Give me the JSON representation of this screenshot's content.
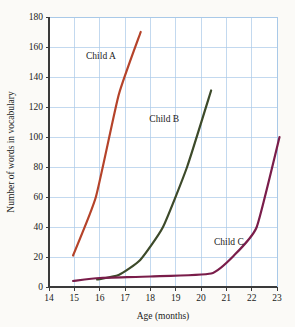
{
  "chart_data": {
    "type": "line",
    "title": "",
    "xlabel": "Age (months)",
    "ylabel": "Number of words in vocabulary",
    "xlim": [
      14,
      23
    ],
    "ylim": [
      0,
      180
    ],
    "xticks": [
      14,
      15,
      16,
      17,
      18,
      19,
      20,
      21,
      22,
      23
    ],
    "xtick_labels": [
      "14",
      "15",
      "16",
      "17",
      "18",
      "19",
      "20",
      "21",
      "22",
      "23"
    ],
    "yticks": [
      0,
      20,
      40,
      60,
      80,
      100,
      120,
      140,
      160,
      180
    ],
    "ytick_labels": [
      "0",
      "20",
      "40",
      "60",
      "80",
      "100",
      "120",
      "140",
      "160",
      "180"
    ],
    "grid": true,
    "grid_color": "#a9c9e8",
    "legend": "inline-labels",
    "background": "#fbfaf7",
    "series": [
      {
        "name": "Child A",
        "color": "#b5432a",
        "label_x": 16.05,
        "label_y": 152,
        "x": [
          14.95,
          15.85,
          16.75,
          17.62
        ],
        "values": [
          21,
          60,
          128,
          170
        ]
      },
      {
        "name": "Child B",
        "color": "#3d4a2a",
        "label_x": 18.55,
        "label_y": 110,
        "x": [
          15.9,
          16.75,
          17.6,
          18.5,
          19.45,
          20.4
        ],
        "values": [
          5,
          8,
          18,
          40,
          80,
          131
        ]
      },
      {
        "name": "Child C",
        "color": "#7a1d4a",
        "label_x": 21.1,
        "label_y": 28,
        "x": [
          14.95,
          16.0,
          18.0,
          20.4,
          21.3,
          22.2,
          23.1
        ],
        "values": [
          4,
          6,
          7,
          9,
          21,
          40,
          100
        ]
      }
    ]
  }
}
